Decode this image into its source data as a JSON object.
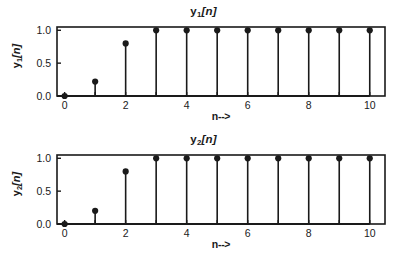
{
  "figure": {
    "background": "#ffffff",
    "ink": "#1a1a1a"
  },
  "panels": [
    {
      "id": "y1",
      "title": "y1[n]",
      "title_base": "y",
      "title_sub": "1",
      "title_tail": "[n]",
      "ylabel_base": "y",
      "ylabel_sub": "1",
      "ylabel_tail": "[n]",
      "xlabel": "n-->"
    },
    {
      "id": "y2",
      "title": "y2[n]",
      "title_base": "y",
      "title_sub": "2",
      "title_tail": "[n]",
      "ylabel_base": "y",
      "ylabel_sub": "2",
      "ylabel_tail": "[n]",
      "xlabel": "n-->"
    }
  ],
  "chart_data": [
    {
      "type": "line",
      "plot_style": "stem",
      "title": "y1[n]",
      "xlabel": "n-->",
      "ylabel": "y1[n]",
      "x": [
        0,
        1,
        2,
        3,
        4,
        5,
        6,
        7,
        8,
        9,
        10
      ],
      "values": [
        0.0,
        0.22,
        0.8,
        1.0,
        1.0,
        1.0,
        1.0,
        1.0,
        1.0,
        1.0,
        1.0
      ],
      "xlim": [
        -0.25,
        10.5
      ],
      "ylim": [
        0.0,
        1.05
      ],
      "xticks": [
        0,
        1,
        2,
        3,
        4,
        5,
        6,
        7,
        8,
        9,
        10
      ],
      "xticklabels": [
        "0",
        "",
        "2",
        "",
        "4",
        "",
        "6",
        "",
        "8",
        "",
        "10"
      ],
      "xticklabels_major": [
        "0",
        "2",
        "4",
        "6",
        "8",
        "10"
      ],
      "yticks": [
        0.0,
        0.5,
        1.0
      ],
      "yticklabels": [
        "0.0",
        "0.5",
        "1.0"
      ],
      "grid": false,
      "legend": false,
      "marker": "filled-circle",
      "line_color": "#1a1a1a"
    },
    {
      "type": "line",
      "plot_style": "stem",
      "title": "y2[n]",
      "xlabel": "n-->",
      "ylabel": "y2[n]",
      "x": [
        0,
        1,
        2,
        3,
        4,
        5,
        6,
        7,
        8,
        9,
        10
      ],
      "values": [
        0.0,
        0.2,
        0.8,
        1.0,
        1.0,
        1.0,
        1.0,
        1.0,
        1.0,
        1.0,
        1.0
      ],
      "xlim": [
        -0.25,
        10.5
      ],
      "ylim": [
        0.0,
        1.05
      ],
      "xticks": [
        0,
        1,
        2,
        3,
        4,
        5,
        6,
        7,
        8,
        9,
        10
      ],
      "xticklabels": [
        "0",
        "",
        "2",
        "",
        "4",
        "",
        "6",
        "",
        "8",
        "",
        "10"
      ],
      "xticklabels_major": [
        "0",
        "2",
        "4",
        "6",
        "8",
        "10"
      ],
      "yticks": [
        0.0,
        0.5,
        1.0
      ],
      "yticklabels": [
        "0.0",
        "0.5",
        "1.0"
      ],
      "grid": false,
      "legend": false,
      "marker": "filled-circle",
      "line_color": "#1a1a1a"
    }
  ]
}
